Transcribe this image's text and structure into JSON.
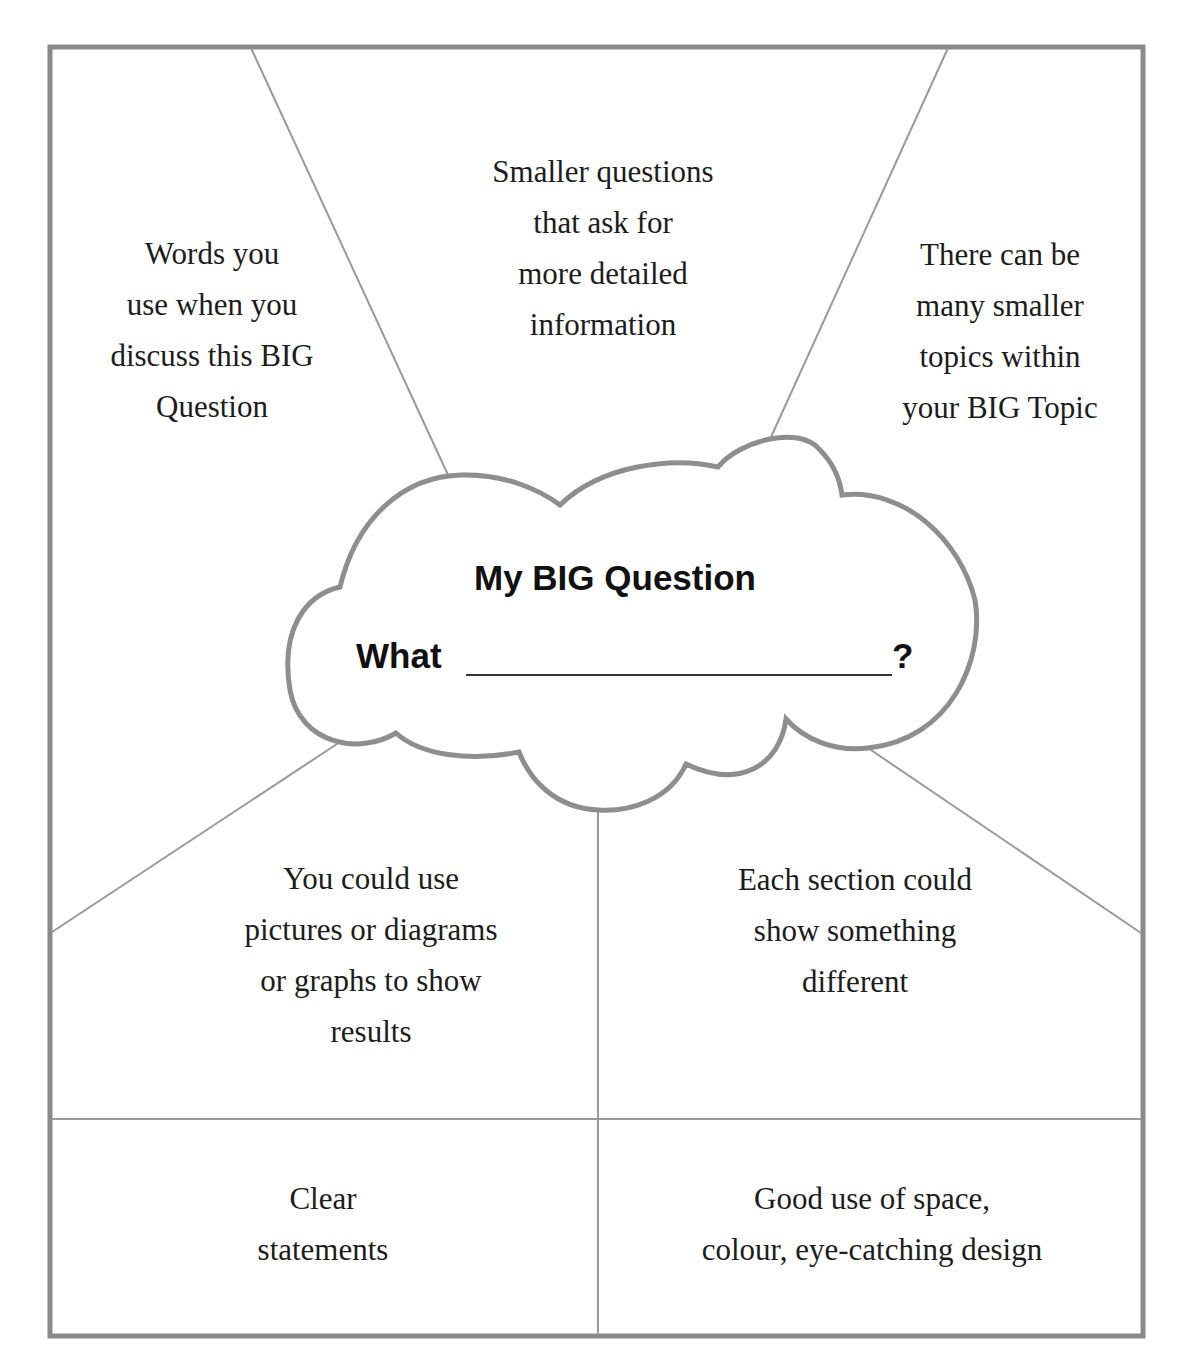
{
  "colors": {
    "frame": "#8a8a8a",
    "divider": "#9a9a9a",
    "cloud_stroke": "#8e8e8e",
    "text": "#1c1c1c",
    "background": "#ffffff"
  },
  "cloud": {
    "title": "My BIG Question",
    "prompt_prefix": "What",
    "prompt_suffix": "?"
  },
  "sections": {
    "top_left": [
      "Words you",
      "use when you",
      "discuss this BIG",
      "Question"
    ],
    "top_center": [
      "Smaller questions",
      "that ask for",
      "more detailed",
      "information"
    ],
    "top_right": [
      "There can be",
      "many smaller",
      "topics within",
      "your BIG Topic"
    ],
    "middle_left": [
      "You could use",
      "pictures or diagrams",
      "or graphs to show",
      "results"
    ],
    "middle_right": [
      "Each section could",
      "show something",
      "different"
    ],
    "bottom_left": [
      "Clear",
      "statements"
    ],
    "bottom_right": [
      "Good use of space,",
      "colour, eye-catching design"
    ]
  }
}
